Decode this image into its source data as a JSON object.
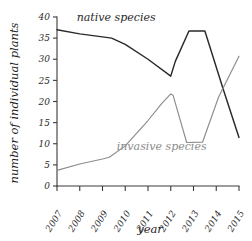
{
  "chart_data": {
    "type": "line",
    "title": "",
    "xlabel": "year",
    "ylabel": "number of individual plants",
    "x": [
      2007,
      2008,
      2009,
      2010,
      2011,
      2012,
      2013,
      2014,
      2015
    ],
    "xtick_labels": [
      "2007",
      "2008",
      "2009",
      "2010",
      "2011",
      "2012",
      "2013",
      "2014",
      "2015"
    ],
    "ytick_labels": [
      "0",
      "5",
      "10",
      "15",
      "20",
      "25",
      "30",
      "35",
      "40"
    ],
    "ytick_values": [
      0,
      5,
      10,
      15,
      20,
      25,
      30,
      35,
      40
    ],
    "xlim": [
      2007,
      2015
    ],
    "ylim": [
      0,
      40
    ],
    "grid": false,
    "legend_position": "inline-annotations",
    "series": [
      {
        "name": "native species",
        "color": "#2a2a2a",
        "label_x": 2009.6,
        "label_y": 39.0,
        "points": [
          {
            "x": 2007.0,
            "y": 37.0
          },
          {
            "x": 2008.0,
            "y": 36.0
          },
          {
            "x": 2009.0,
            "y": 35.3
          },
          {
            "x": 2009.4,
            "y": 35.0
          },
          {
            "x": 2010.0,
            "y": 33.5
          },
          {
            "x": 2011.0,
            "y": 30.0
          },
          {
            "x": 2012.0,
            "y": 26.0
          },
          {
            "x": 2012.2,
            "y": 29.5
          },
          {
            "x": 2012.8,
            "y": 36.7
          },
          {
            "x": 2013.5,
            "y": 36.7
          },
          {
            "x": 2014.3,
            "y": 23.0
          },
          {
            "x": 2015.0,
            "y": 11.5
          }
        ]
      },
      {
        "name": "invasive species",
        "color": "#8c8c8c",
        "label_x": 2011.6,
        "label_y": 8.6,
        "points": [
          {
            "x": 2007.0,
            "y": 3.7
          },
          {
            "x": 2008.0,
            "y": 5.2
          },
          {
            "x": 2009.0,
            "y": 6.4
          },
          {
            "x": 2009.3,
            "y": 6.8
          },
          {
            "x": 2010.0,
            "y": 9.5
          },
          {
            "x": 2011.0,
            "y": 15.5
          },
          {
            "x": 2011.6,
            "y": 19.5
          },
          {
            "x": 2012.0,
            "y": 21.8
          },
          {
            "x": 2012.1,
            "y": 21.5
          },
          {
            "x": 2012.7,
            "y": 10.3
          },
          {
            "x": 2013.4,
            "y": 10.4
          },
          {
            "x": 2014.1,
            "y": 21.0
          },
          {
            "x": 2015.0,
            "y": 30.7
          }
        ]
      }
    ]
  }
}
